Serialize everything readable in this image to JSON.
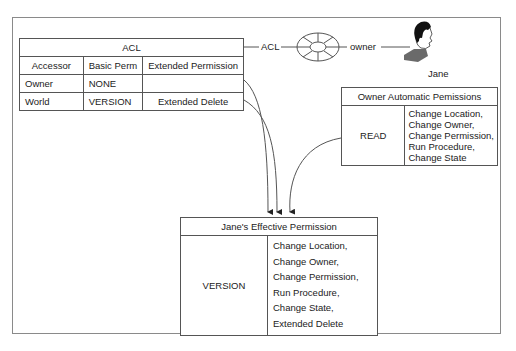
{
  "acl_table": {
    "title": "ACL",
    "columns": [
      "Accessor",
      "Basic Perm",
      "Extended Permission"
    ],
    "rows": [
      {
        "accessor": "Owner",
        "basic": "NONE",
        "extended": ""
      },
      {
        "accessor": "World",
        "basic": "VERSION",
        "extended": "Extended Delete"
      }
    ]
  },
  "connector": {
    "acl_label": "ACL",
    "owner_label": "owner",
    "wheel_icon": "acl-wheel-icon",
    "person_icon": "person-icon",
    "person_name": "Jane"
  },
  "owner_auto": {
    "title": "Owner Automatic Pemissions",
    "basic": "READ",
    "extended": [
      "Change Location,",
      "Change Owner,",
      "Change Permission,",
      "Run Procedure,",
      "Change State"
    ]
  },
  "effective": {
    "title": "Jane's Effective Permission",
    "basic": "VERSION",
    "extended": [
      "Change Location,",
      "Change Owner,",
      "Change Permission,",
      "Run Procedure,",
      "Change State,",
      "Extended Delete"
    ]
  },
  "colors": {
    "line": "#555555",
    "frame": "#8a8a8a",
    "hair": "#111111",
    "shirt": "#6a6a6a"
  }
}
